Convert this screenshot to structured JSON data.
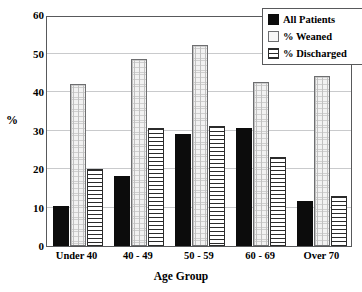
{
  "chart_data": {
    "type": "bar",
    "title": "",
    "xlabel": "Age Group",
    "ylabel": "%",
    "categories": [
      "Under 40",
      "40 - 49",
      "50 - 59",
      "60 - 69",
      "Over 70"
    ],
    "series": [
      {
        "name": "All Patients",
        "pattern": "solid-black",
        "values": [
          10.5,
          18.3,
          29.2,
          30.6,
          11.8
        ]
      },
      {
        "name": "% Weaned",
        "pattern": "light-dotted",
        "values": [
          42.0,
          48.6,
          52.2,
          42.5,
          44.1
        ]
      },
      {
        "name": "% Discharged",
        "pattern": "horizontal-lines",
        "values": [
          20.0,
          30.6,
          31.3,
          23.2,
          12.9
        ]
      }
    ],
    "ylim": [
      0,
      60
    ],
    "yticks": [
      0,
      10,
      20,
      30,
      40,
      50,
      60
    ],
    "ytick_labels": [
      "0",
      "10",
      "20",
      "30",
      "40",
      "50",
      "60"
    ],
    "grid": true,
    "grid_axis": "y",
    "legend_position": "top-right",
    "colors": {
      "all_patients": "#0c0c0c",
      "weaned": "#f2f2f2",
      "discharged": "#ffffff",
      "axis": "#58595b",
      "grid": "#c9cacc"
    }
  },
  "legend": {
    "items": [
      {
        "label": "All Patients"
      },
      {
        "label": "% Weaned"
      },
      {
        "label": "% Discharged"
      }
    ]
  }
}
